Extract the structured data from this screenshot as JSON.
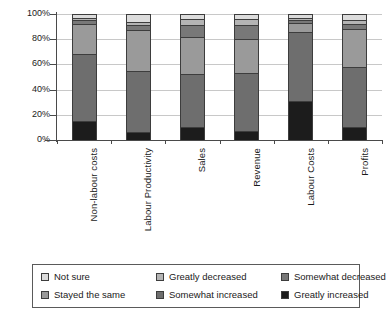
{
  "chart_data": {
    "type": "bar",
    "subtype": "stacked-percent-column",
    "title": "",
    "xlabel": "",
    "ylabel": "",
    "ylim": [
      0,
      100
    ],
    "ytick_labels": [
      "0%",
      "20%",
      "40%",
      "60%",
      "80%",
      "100%"
    ],
    "ytick_values": [
      0,
      20,
      40,
      60,
      80,
      100
    ],
    "grid": true,
    "legend_position": "bottom",
    "stack_order_bottom_to_top": [
      "Greatly increased",
      "Somewhat increased",
      "Stayed the same",
      "Somewhat decreased",
      "Greatly decreased",
      "Not sure"
    ],
    "categories": [
      "Non-labour costs",
      "Labour Productivity",
      "Sales",
      "Revenue",
      "Labour Costs",
      "Profits"
    ],
    "series": [
      {
        "name": "Greatly increased",
        "color": "#1c1c1c",
        "values": [
          15,
          6,
          10,
          7,
          31,
          10
        ]
      },
      {
        "name": "Somewhat increased",
        "color": "#6e6e6e",
        "values": [
          53,
          49,
          42,
          46,
          55,
          48
        ]
      },
      {
        "name": "Stayed the same",
        "color": "#9a9a9a",
        "values": [
          24,
          32,
          30,
          27,
          7,
          30
        ]
      },
      {
        "name": "Somewhat decreased",
        "color": "#787878",
        "values": [
          3,
          4,
          9,
          11,
          2,
          4
        ]
      },
      {
        "name": "Greatly decreased",
        "color": "#b4b4b4",
        "values": [
          2,
          3,
          5,
          5,
          2,
          3
        ]
      },
      {
        "name": "Not sure",
        "color": "#dcdcdc",
        "values": [
          3,
          6,
          4,
          4,
          3,
          5
        ]
      }
    ]
  },
  "legend": {
    "entries": [
      {
        "label": "Not sure",
        "color": "#dcdcdc"
      },
      {
        "label": "Greatly decreased",
        "color": "#b4b4b4"
      },
      {
        "label": "Somewhat decreased",
        "color": "#787878"
      },
      {
        "label": "Stayed the same",
        "color": "#9a9a9a"
      },
      {
        "label": "Somewhat increased",
        "color": "#6e6e6e"
      },
      {
        "label": "Greatly increased",
        "color": "#1c1c1c"
      }
    ]
  }
}
